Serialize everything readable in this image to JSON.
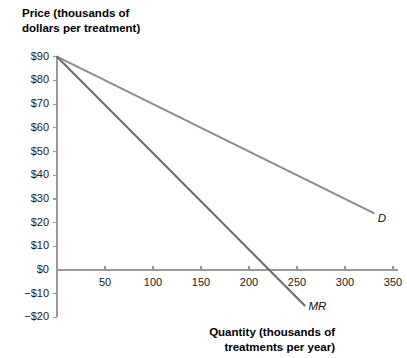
{
  "chart_data": {
    "type": "line",
    "title": "",
    "ylabel": "Price (thousands of\ndollars per treatment)",
    "xlabel": "Quantity (thousands of\ntreatments per year)",
    "xlim": [
      0,
      360
    ],
    "ylim": [
      -20,
      90
    ],
    "grid": false,
    "legend_position": "inline-at-line-end",
    "x_ticks": [
      50,
      100,
      150,
      200,
      250,
      300,
      350
    ],
    "x_tick_labels": [
      "50",
      "100",
      "150",
      "200",
      "250",
      "300",
      "350"
    ],
    "y_ticks": [
      90,
      80,
      70,
      60,
      50,
      40,
      30,
      20,
      10,
      0,
      -10,
      -20
    ],
    "y_tick_labels": [
      "$90",
      "$80",
      "$70",
      "$60",
      "$50",
      "$40",
      "$30",
      "$20",
      "$10",
      "$0",
      "−$10",
      "−$20"
    ],
    "series": [
      {
        "name": "D",
        "label": "D",
        "color": "#8c8c8c",
        "points": [
          [
            0,
            90
          ],
          [
            330,
            24
          ]
        ],
        "intercept": 90,
        "slope": -0.2
      },
      {
        "name": "MR",
        "label": "MR",
        "color": "#6b6b6b",
        "points": [
          [
            0,
            90
          ],
          [
            258,
            -15
          ]
        ],
        "intercept": 90,
        "slope": -0.4071,
        "x_intercept": 225
      }
    ],
    "annotations": [
      {
        "text": "D",
        "x": 334,
        "y": 21
      },
      {
        "text": "MR",
        "x": 262,
        "y": -16
      }
    ]
  },
  "axes": {
    "axis_color": "#999999",
    "tick_color": "#999999",
    "text_color": "#1a1a1a",
    "background": "#ffffff"
  }
}
